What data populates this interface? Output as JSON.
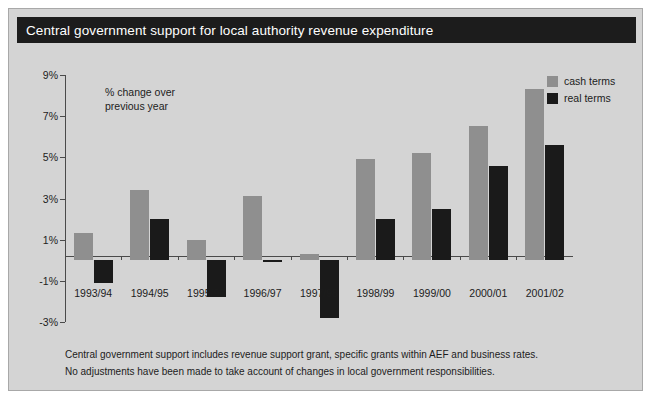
{
  "title": "Central government support for local authority revenue expenditure",
  "annotation": [
    "% change over",
    "previous year"
  ],
  "legend": [
    {
      "label": "cash terms",
      "color": "#8f8f8f",
      "key": "cash"
    },
    {
      "label": "real terms",
      "color": "#1a1a1a",
      "key": "real"
    }
  ],
  "footnotes": [
    "Central government support includes revenue support grant, specific grants within AEF and business rates.",
    "No adjustments have been made to take account of changes in local government responsibilities."
  ],
  "chart_data": {
    "type": "bar",
    "title": "Central government support for local authority revenue expenditure",
    "subtitle": "% change over previous year",
    "xlabel": "",
    "ylabel": "% change over previous year",
    "ylim": [
      -3,
      9
    ],
    "ytick_step": 2,
    "ytick_labels": [
      "9%",
      "7%",
      "5%",
      "3%",
      "1%",
      "-1%",
      "-3%"
    ],
    "ytick_values": [
      9,
      7,
      5,
      3,
      1,
      -1,
      -3
    ],
    "grid": false,
    "legend_position": "top-right",
    "categories": [
      "1993/94",
      "1994/95",
      "1995/96",
      "1996/97",
      "1997/98",
      "1998/99",
      "1999/00",
      "2000/01",
      "2001/02"
    ],
    "series": [
      {
        "name": "cash terms",
        "color": "#8f8f8f",
        "values": [
          1.3,
          3.4,
          1.0,
          3.1,
          0.3,
          4.9,
          5.2,
          6.5,
          8.3
        ]
      },
      {
        "name": "real terms",
        "color": "#1a1a1a",
        "values": [
          -1.1,
          2.0,
          -1.8,
          -0.1,
          -2.8,
          2.0,
          2.5,
          4.6,
          5.6
        ]
      }
    ]
  }
}
